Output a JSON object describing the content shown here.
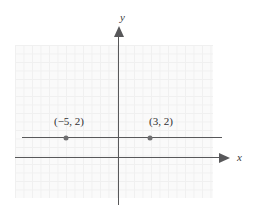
{
  "figure": {
    "type": "coordinate-plane-graph",
    "background_color": "#ffffff",
    "grid_color": "#f0f0f0",
    "axis_color": "#58585a",
    "line_color": "#58585a",
    "point_color": "#6e6e70",
    "axes": {
      "x_label": "x",
      "y_label": "y"
    },
    "points": [
      {
        "label": "(−5, 2)",
        "x": -5,
        "y": 2
      },
      {
        "label": "(3, 2)",
        "x": 3,
        "y": 2
      }
    ]
  },
  "chart_data": {
    "type": "line",
    "title": "",
    "xlabel": "x",
    "ylabel": "y",
    "grid": true,
    "legend": "none",
    "xlim": [
      -12,
      11
    ],
    "ylim": [
      -5,
      13
    ],
    "series": [
      {
        "name": "y = 2",
        "x": [
          -11,
          12
        ],
        "values": [
          2,
          2
        ],
        "annotations": [
          {
            "text": "(−5, 2)",
            "x": -5,
            "y": 2
          },
          {
            "text": "(3, 2)",
            "x": 3,
            "y": 2
          }
        ]
      }
    ],
    "points": [
      {
        "label": "(−5, 2)",
        "x": -5,
        "y": 2
      },
      {
        "label": "(3, 2)",
        "x": 3,
        "y": 2
      }
    ]
  }
}
